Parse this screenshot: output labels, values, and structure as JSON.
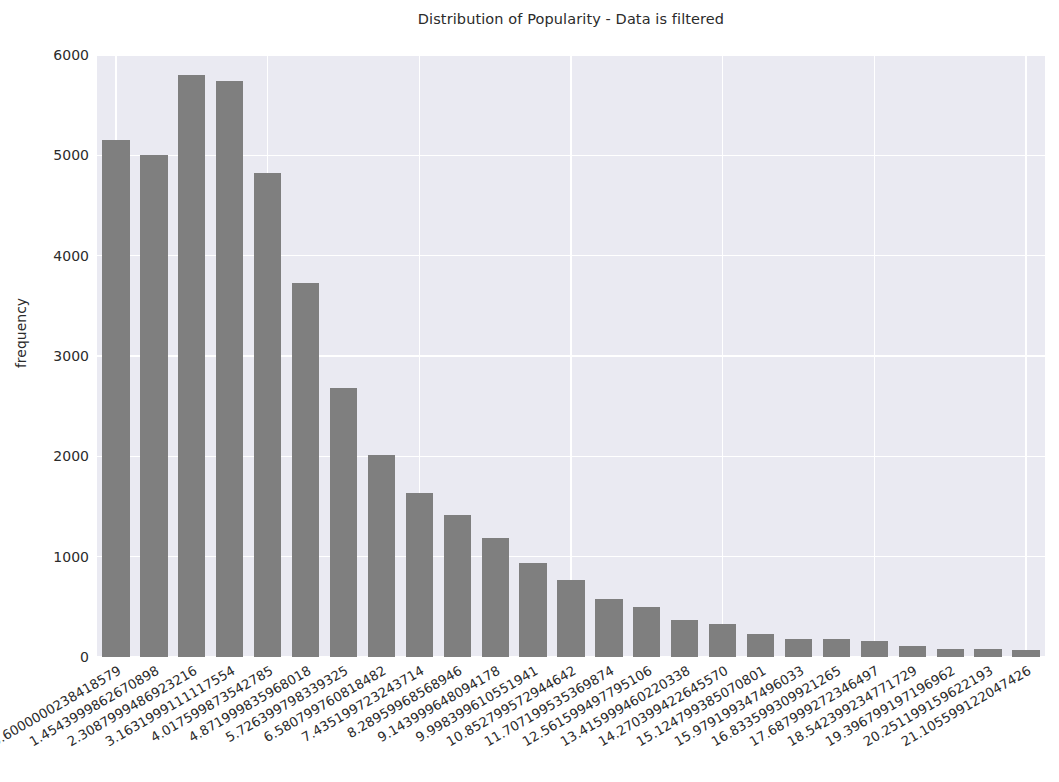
{
  "chart_data": {
    "type": "bar",
    "title": "Distribution of Popularity - Data is filtered",
    "xlabel": "",
    "ylabel": "frequency",
    "ylim": [
      0,
      6000
    ],
    "yticks": [
      0,
      1000,
      2000,
      3000,
      4000,
      5000,
      6000
    ],
    "ytick_labels": [
      "0",
      "1000",
      "2000",
      "3000",
      "4000",
      "5000",
      "6000"
    ],
    "grid": true,
    "legend": null,
    "style": "seaborn-darkgrid",
    "bar_color": "#7f7f7f",
    "axes_facecolor": "#eaeaf2",
    "figure_facecolor": "#ffffff",
    "categories": [
      "0.6000000238418579",
      "1.4543999862670898",
      "2.3087999486923216",
      "3.1631999111117554",
      "4.017599873542785",
      "4.871999835968018",
      "5.726399798339325",
      "6.580799760818482",
      "7.435199723243714",
      "8.28959968568946",
      "9.143999648094178",
      "9.998399610551941",
      "10.852799572944642",
      "11.707199535369874",
      "12.561599497795106",
      "13.415999460220338",
      "14.270399422645570",
      "15.124799385070801",
      "15.979199347496033",
      "16.833599309921265",
      "17.687999272346497",
      "18.542399234771729",
      "19.396799197196962",
      "20.251199159622193",
      "21.105599122047426"
    ],
    "values": [
      5150,
      5000,
      5800,
      5740,
      4820,
      3730,
      2680,
      2010,
      1630,
      1420,
      1190,
      940,
      770,
      580,
      500,
      370,
      330,
      225,
      175,
      180,
      155,
      110,
      80,
      75,
      70
    ]
  }
}
